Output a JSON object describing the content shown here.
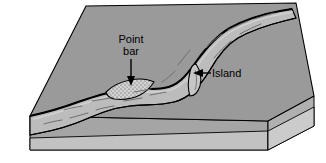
{
  "figure": {
    "type": "geologic-block-diagram",
    "background_color": "#ffffff",
    "width": 326,
    "height": 163
  },
  "labels": {
    "point_bar": {
      "line1": "Point",
      "line2": "bar",
      "pointer": "down-arrow",
      "target": "point-bar-deposit"
    },
    "island": {
      "text": "Island",
      "pointer": "left-arrow",
      "target": "mid-channel-island"
    }
  },
  "colors": {
    "upland_surface": "#9a9a9a",
    "channel_fill": "#bcbcbc",
    "point_bar": "#cfcfcf",
    "block_front_face": "#a5a5a5",
    "block_front_stratum": "#c4c4c4",
    "block_side_face": "#b0b0b0",
    "block_side_stratum": "#cccccc",
    "outline": "#000000",
    "label_text": "#000000",
    "background": "#ffffff"
  },
  "features": [
    {
      "name": "upland-surface",
      "description": "Flat grey upland terrace forming the top of the block"
    },
    {
      "name": "river-channel",
      "description": "Meandering river channel crossing the block from lower-left to upper-right"
    },
    {
      "name": "point-bar-deposit",
      "description": "Stippled crescent sand deposit on the inside of the meander bend"
    },
    {
      "name": "mid-channel-island",
      "description": "Small lens-shaped island within the channel at the bend"
    },
    {
      "name": "cut-bank",
      "description": "Steep dark eroded bank on the outside of the meander"
    },
    {
      "name": "block-front-face",
      "description": "Cut-away front face of the earth block showing strata"
    },
    {
      "name": "block-side-face",
      "description": "Cut-away right side face of the earth block showing strata"
    }
  ]
}
